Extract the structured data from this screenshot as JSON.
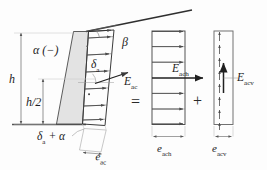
{
  "figure": {
    "background_color": "#fdfdfd",
    "line_color": "#3a3a3a",
    "wall_fill_color": "#e2e2e2",
    "ground_color": "#555555"
  },
  "labels": {
    "alpha_neg": "α (−)",
    "beta": "β",
    "h": "h",
    "h_half": "h/2",
    "delta_a": "δ",
    "delta_a_sub": "a",
    "delta_a_plus_alpha": "δ",
    "delta_a_plus_alpha_sub": "a",
    "delta_a_plus_alpha_tail": " + α",
    "e_ac": "e",
    "e_ac_sub": "ac",
    "E_ac": "E",
    "E_ac_sub": "ac",
    "E_ach": "E",
    "E_ach_sub": "ach",
    "E_acv": "E",
    "E_acv_sub": "acv",
    "e_ach": "e",
    "e_ach_sub": "ach",
    "e_acv": "e",
    "e_acv_sub": "acv"
  },
  "operators": {
    "equals": "=",
    "plus": "+"
  },
  "diagram_data": {
    "type": "engineering-diagram",
    "description": "Resultant inclined active earth pressure E_ac decomposed into horizontal component E_ach and vertical component E_acv",
    "wall": {
      "inclination_label": "α (−)",
      "height_label": "h",
      "midheight_label": "h/2",
      "backfill_slope_label": "β",
      "wall_friction_label": "δa"
    },
    "panels": [
      {
        "name": "inclined-pressure-panel",
        "resultant": "E_ac",
        "pressure_ordinate": "e_ac",
        "arrow_rows": 6,
        "arrow_direction": "inclined-right"
      },
      {
        "name": "horizontal-pressure-panel",
        "resultant": "E_ach",
        "pressure_ordinate": "e_ach",
        "arrow_rows": 6,
        "arrow_direction": "right"
      },
      {
        "name": "vertical-pressure-panel",
        "resultant": "E_acv",
        "pressure_ordinate": "e_acv",
        "arrow_rows": 10,
        "arrow_direction": "up"
      }
    ],
    "relation": "E_ac = E_ach + E_acv"
  }
}
